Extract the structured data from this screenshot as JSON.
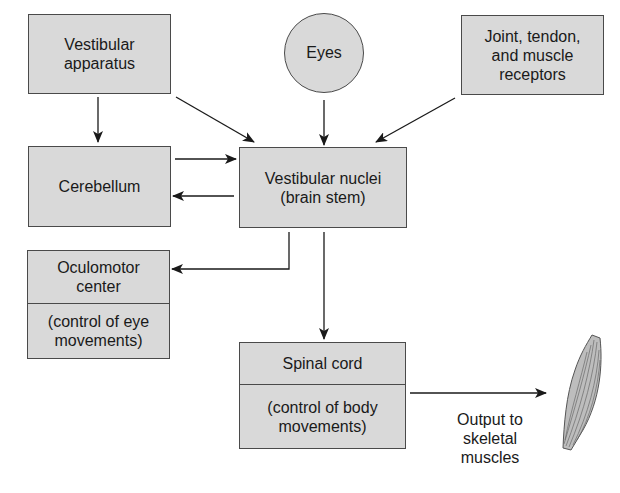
{
  "diagram": {
    "nodes": {
      "vestibular_apparatus": {
        "label": "Vestibular\napparatus"
      },
      "eyes": {
        "label": "Eyes"
      },
      "joint_receptors": {
        "label": "Joint, tendon,\nand muscle\nreceptors"
      },
      "cerebellum": {
        "label": "Cerebellum"
      },
      "vestibular_nuclei": {
        "label": "Vestibular nuclei\n(brain stem)"
      },
      "oculomotor": {
        "title": "Oculomotor\ncenter",
        "subtitle": "(control of eye\nmovements)"
      },
      "spinal_cord": {
        "title": "Spinal cord",
        "subtitle": "(control of body\nmovements)"
      }
    },
    "output_label": "Output to\nskeletal\nmuscles",
    "edges": [
      {
        "from": "vestibular_apparatus",
        "to": "cerebellum"
      },
      {
        "from": "vestibular_apparatus",
        "to": "vestibular_nuclei"
      },
      {
        "from": "eyes",
        "to": "vestibular_nuclei"
      },
      {
        "from": "joint_receptors",
        "to": "vestibular_nuclei"
      },
      {
        "from": "cerebellum",
        "to": "vestibular_nuclei"
      },
      {
        "from": "vestibular_nuclei",
        "to": "cerebellum"
      },
      {
        "from": "vestibular_nuclei",
        "to": "oculomotor"
      },
      {
        "from": "vestibular_nuclei",
        "to": "spinal_cord"
      },
      {
        "from": "spinal_cord",
        "to": "skeletal_muscle"
      }
    ],
    "colors": {
      "box_fill": "#d9d9d9",
      "stroke": "#4a4a4a",
      "arrow": "#1a1a1a"
    }
  }
}
